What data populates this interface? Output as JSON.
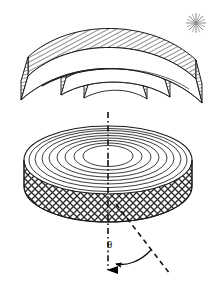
{
  "figure": {
    "title": "",
    "background_color": "#ffffff",
    "stroke_color": "#1a1a1a",
    "hatch_color": "#444444",
    "width": 217,
    "height": 286,
    "labels": {
      "theta": "θ"
    },
    "upper_object": {
      "name": "nested-hatched-arc-segments",
      "description": "Exploded stack of nested curved annular sector shells drawn in oblique 3D with diagonal line hatching",
      "segment_count": 4,
      "hatch_style": "diagonal-lines",
      "hatch_angle_deg": 60,
      "segments": [
        {
          "index": 0,
          "label": "outer-shell"
        },
        {
          "index": 1,
          "label": "second-shell"
        },
        {
          "index": 2,
          "label": "third-shell"
        },
        {
          "index": 3,
          "label": "inner-shell"
        }
      ],
      "marker": {
        "name": "starburst",
        "glyph": "*",
        "ray_count": 8,
        "x": 196,
        "y": 23,
        "radius": 10,
        "color": "#888888"
      }
    },
    "lower_object": {
      "name": "contoured-disk",
      "description": "Cylindrical disk with concentric elliptical contour rings on the top face and diamond cross-hatching on the side wall",
      "top_face": {
        "name": "contour-rings",
        "ring_count": 8,
        "center_x": 108,
        "center_y": 160,
        "outer_rx": 84,
        "outer_ry": 34
      },
      "side_wall": {
        "name": "crosshatched-side",
        "hatch_style": "diamond-crosshatch",
        "height": 46
      }
    },
    "annotations": {
      "axis": {
        "name": "rotation-axis",
        "style": "dash-dot",
        "x": 108,
        "y_top": 112,
        "y_bottom": 276,
        "arrowhead": "solid-down"
      },
      "tilt_line": {
        "name": "tilted-reference-line",
        "style": "dashed",
        "x1": 116,
        "y1": 204,
        "x2": 168,
        "y2": 272
      },
      "angle_arc": {
        "name": "theta-angle-arc",
        "label": "θ",
        "arrow": "curved-left",
        "center_x": 108,
        "center_y": 204
      }
    }
  }
}
